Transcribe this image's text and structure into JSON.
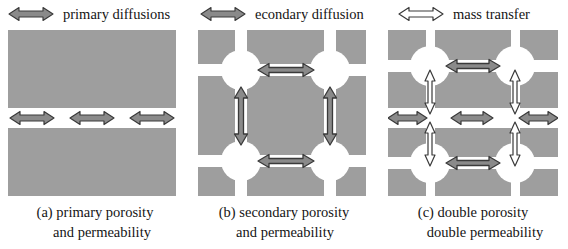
{
  "figure": {
    "width": 568,
    "height": 249,
    "background": "#ffffff"
  },
  "colors": {
    "matrix_gray": "#9e9e9e",
    "fracture_white": "#ffffff",
    "arrow_fill_gray": "#8a8a8a",
    "arrow_outline_dark": "#3a3a3a",
    "mass_transfer_fill": "#ffffff",
    "text": "#151515"
  },
  "legend": {
    "items": [
      {
        "id": "primary-diffusions",
        "label": "primary diffusions",
        "arrow_style": "filled-gray-double-arrow",
        "arrow_direction": "horizontal"
      },
      {
        "id": "secondary-diffusion",
        "label": "econdary diffusion",
        "arrow_style": "filled-gray-double-arrow",
        "arrow_direction": "horizontal"
      },
      {
        "id": "mass-transfer",
        "label": "mass transfer",
        "arrow_style": "hollow-white-double-arrow",
        "arrow_direction": "horizontal"
      }
    ]
  },
  "panels": [
    {
      "id": "panel-a",
      "caption_line_1": "(a) primary porosity",
      "caption_line_2": "and permeability",
      "description": "single horizontal fracture through gray matrix",
      "horizontal_fractures": [
        {
          "y": 78,
          "thickness": 20
        }
      ],
      "vertical_fractures": [],
      "nodes": [],
      "diffusion_arrows": [
        {
          "orientation": "horizontal",
          "cx": 24,
          "cy": 88,
          "length": 44
        },
        {
          "orientation": "horizontal",
          "cx": 84,
          "cy": 88,
          "length": 44
        },
        {
          "orientation": "horizontal",
          "cx": 144,
          "cy": 88,
          "length": 44
        }
      ],
      "mass_transfer_arrows": []
    },
    {
      "id": "panel-b",
      "caption_line_1": "(b) secondary porosity",
      "caption_line_2": "and permeability",
      "description": "orthogonal fracture grid with circular nodes at intersections",
      "horizontal_fractures": [
        {
          "y": 34,
          "thickness": 11
        },
        {
          "y": 125,
          "thickness": 11
        }
      ],
      "vertical_fractures": [
        {
          "x": 38,
          "thickness": 11
        },
        {
          "x": 127,
          "thickness": 11
        }
      ],
      "nodes": [
        {
          "cx": 43,
          "cy": 40,
          "r": 20
        },
        {
          "cx": 132,
          "cy": 40,
          "r": 20
        },
        {
          "cx": 43,
          "cy": 131,
          "r": 20
        },
        {
          "cx": 132,
          "cy": 131,
          "r": 20
        }
      ],
      "diffusion_arrows": [
        {
          "orientation": "horizontal",
          "cx": 88,
          "cy": 40,
          "length": 56
        },
        {
          "orientation": "horizontal",
          "cx": 88,
          "cy": 131,
          "length": 56
        },
        {
          "orientation": "vertical",
          "cx": 43,
          "cy": 86,
          "length": 58
        },
        {
          "orientation": "vertical",
          "cx": 132,
          "cy": 86,
          "length": 58
        }
      ],
      "mass_transfer_arrows": []
    },
    {
      "id": "panel-c",
      "caption_line_1": "(c) double porosity",
      "caption_line_2": "double permeability",
      "description": "fracture grid combined with a central primary horizontal fracture; hollow arrows show mass transfer between matrix and fracture",
      "horizontal_fractures": [
        {
          "y": 30,
          "thickness": 11
        },
        {
          "y": 78,
          "thickness": 20
        },
        {
          "y": 127,
          "thickness": 11
        }
      ],
      "vertical_fractures": [
        {
          "x": 38,
          "thickness": 9
        },
        {
          "x": 123,
          "thickness": 9
        }
      ],
      "nodes": [
        {
          "cx": 42,
          "cy": 36,
          "r": 20
        },
        {
          "cx": 127,
          "cy": 36,
          "r": 20
        },
        {
          "cx": 42,
          "cy": 133,
          "r": 20
        },
        {
          "cx": 127,
          "cy": 133,
          "r": 20
        }
      ],
      "diffusion_arrows": [
        {
          "orientation": "horizontal",
          "cx": 85,
          "cy": 36,
          "length": 54
        },
        {
          "orientation": "horizontal",
          "cx": 85,
          "cy": 133,
          "length": 54
        },
        {
          "orientation": "horizontal",
          "cx": 17,
          "cy": 88,
          "length": 42
        },
        {
          "orientation": "horizontal",
          "cx": 84,
          "cy": 88,
          "length": 42
        },
        {
          "orientation": "horizontal",
          "cx": 152,
          "cy": 88,
          "length": 42
        }
      ],
      "mass_transfer_arrows": [
        {
          "orientation": "vertical",
          "cx": 42,
          "cy": 58,
          "length": 40
        },
        {
          "orientation": "vertical",
          "cx": 127,
          "cy": 58,
          "length": 40
        },
        {
          "orientation": "vertical",
          "cx": 42,
          "cy": 112,
          "length": 40
        },
        {
          "orientation": "vertical",
          "cx": 127,
          "cy": 112,
          "length": 40
        }
      ]
    }
  ]
}
